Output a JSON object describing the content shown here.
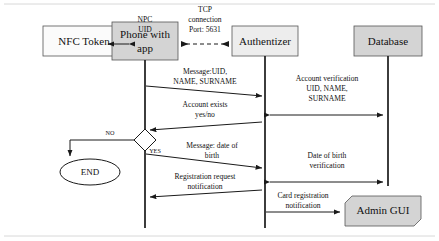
{
  "diagram": {
    "type": "sequence-diagram",
    "colors": {
      "background": "#ffffff",
      "line": "#1a1a1a",
      "box_border": "#555555",
      "box_fill_gray": "#d4d4d4",
      "box_fill_light": "#ededed",
      "box_fill_white": "#fbfbfb",
      "frame": "#d8d8d8"
    },
    "participants": [
      {
        "id": "nfc-token",
        "label": "NFC Token",
        "fill": "#fbfbfb",
        "x": 43,
        "y": 26,
        "w": 82,
        "h": 30,
        "has_lifeline": false,
        "shape": "rect"
      },
      {
        "id": "phone",
        "label": "Phone with\napp",
        "line1": "Phone with",
        "line2": "app",
        "fill": "#d4d4d4",
        "x": 112,
        "y": 22,
        "w": 66,
        "h": 38,
        "has_lifeline": true,
        "shape": "rect"
      },
      {
        "id": "authentizer",
        "label": "Authentizer",
        "fill": "#ededed",
        "x": 232,
        "y": 26,
        "w": 66,
        "h": 30,
        "has_lifeline": true,
        "shape": "rect"
      },
      {
        "id": "database",
        "label": "Database",
        "fill": "#d4d4d4",
        "x": 354,
        "y": 26,
        "w": 68,
        "h": 30,
        "has_lifeline": true,
        "shape": "rect"
      },
      {
        "id": "admin-gui",
        "label": "Admin GUI",
        "fill": "#d4d4d4",
        "x": 345,
        "y": 196,
        "w": 76,
        "h": 30,
        "has_lifeline": false,
        "shape": "note"
      }
    ],
    "messages": [
      {
        "id": "npc-uid",
        "line1": "NPC",
        "line2": "UID",
        "from": "nfc-token",
        "to": "phone",
        "direction": "both",
        "style": "solid",
        "label_x": 145,
        "label_y1": 22,
        "label_y2": 32
      },
      {
        "id": "tcp-connection",
        "line1": "TCP",
        "line2": "connection",
        "line3": "Port: 5631",
        "from": "phone",
        "to": "authentizer",
        "direction": "both",
        "style": "dashed",
        "label_x": 205,
        "label_y1": 12,
        "label_y2": 22,
        "label_y3": 32
      },
      {
        "id": "message-uid-name-surname",
        "line1": "Message:UID,",
        "line2": "NAME, SURNAME",
        "from": "phone",
        "to": "authentizer",
        "direction": "right",
        "style": "solid"
      },
      {
        "id": "account-verification",
        "line1": "Account verification",
        "line2": "UID, NAME,",
        "line3": "SURNAME",
        "from": "authentizer",
        "to": "database",
        "direction": "both",
        "style": "solid"
      },
      {
        "id": "account-exists",
        "line1": "Account exists",
        "line2": "yes/no",
        "from": "authentizer",
        "to": "phone",
        "direction": "left",
        "style": "solid"
      },
      {
        "id": "message-date-of-birth",
        "line1": "Message: date of",
        "line2": "birth",
        "from": "phone",
        "to": "authentizer",
        "direction": "right",
        "style": "solid"
      },
      {
        "id": "date-of-birth-verification",
        "line1": "Date of birth",
        "line2": "verification",
        "from": "authentizer",
        "to": "database",
        "direction": "both",
        "style": "solid"
      },
      {
        "id": "registration-request-notification",
        "line1": "Registration request",
        "line2": "notification",
        "from": "authentizer",
        "to": "phone",
        "direction": "left",
        "style": "solid"
      },
      {
        "id": "card-registration-notification",
        "line1": "Card registration",
        "line2": "notification",
        "from": "authentizer",
        "to": "admin-gui",
        "direction": "right",
        "style": "solid"
      }
    ],
    "decision": {
      "id": "account-exists-decision",
      "cx": 145,
      "cy": 140,
      "rx": 11,
      "ry": 11,
      "branch_no": "NO",
      "branch_yes": "YES",
      "no_label_x": 109,
      "no_label_y": 134,
      "yes_label_x": 155,
      "yes_label_y": 153
    },
    "end_node": {
      "id": "end-node",
      "label": "END",
      "cx": 90,
      "cy": 172,
      "rx": 30,
      "ry": 13
    }
  }
}
